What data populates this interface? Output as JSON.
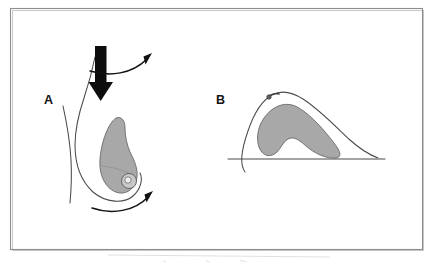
{
  "figure": {
    "type": "anatomical-line-diagram",
    "background_color": "#ffffff",
    "frame": {
      "stroke_color": "#8d8d90",
      "x": 10,
      "y": 8,
      "width": 413,
      "height": 242
    },
    "colors": {
      "tissue_fill": "#a8a8a8",
      "tissue_stroke": "#6a6a6a",
      "contour_stroke": "#4a4a4a",
      "arrow_fill": "#0d0d0d",
      "label_text": "#141414",
      "frame": "#8d8d90"
    },
    "panels": [
      {
        "id": "panel-a",
        "label": "A",
        "label_x": 44,
        "label_y": 104,
        "description": "Sagittal view of uncompressed breast on chest wall with downward compression arrow and curved motion arrows",
        "elements": [
          "torso-contour",
          "breast-outline",
          "glandular-tissue",
          "nipple",
          "compression-arrow-down",
          "curved-arrow-upper",
          "curved-arrow-lower"
        ]
      },
      {
        "id": "panel-b",
        "label": "B",
        "label_x": 216,
        "label_y": 104,
        "description": "Sagittal view of compressed breast flattened against horizontal chest wall baseline",
        "elements": [
          "chest-wall-baseline",
          "compressed-breast-outline",
          "compressed-glandular-tissue",
          "nipple"
        ]
      }
    ]
  }
}
